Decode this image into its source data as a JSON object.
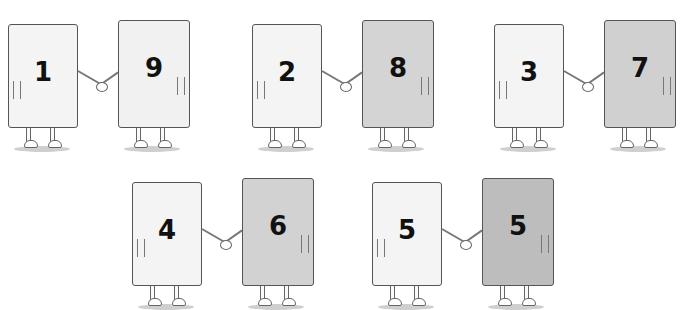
{
  "colors": {
    "light_card": "#f4f4f4",
    "medium_card": "#d6d6d6",
    "dark_card": "#c4c4c4",
    "outline": "#555555"
  },
  "pairs": [
    {
      "left": "1",
      "right": "9",
      "x": 0,
      "y": 0,
      "right_color": "#f1f1f1"
    },
    {
      "left": "2",
      "right": "8",
      "x": 244,
      "y": 0,
      "right_color": "#d4d4d4"
    },
    {
      "left": "3",
      "right": "7",
      "x": 486,
      "y": 0,
      "right_color": "#d0d0d0"
    },
    {
      "left": "4",
      "right": "6",
      "x": 124,
      "y": 158,
      "right_color": "#d2d2d2"
    },
    {
      "left": "5",
      "right": "5",
      "x": 364,
      "y": 158,
      "right_color": "#bdbdbd"
    }
  ]
}
